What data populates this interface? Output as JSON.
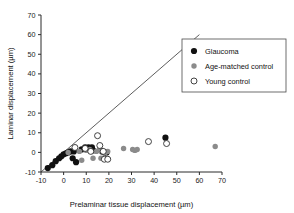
{
  "chart_data": {
    "type": "scatter",
    "title": "",
    "xlabel": "Prelaminar tissue displacement (µm)",
    "ylabel": "Laminar displacement (µm)",
    "xlim": [
      -10,
      70
    ],
    "ylim": [
      -10,
      70
    ],
    "xticks": [
      -10,
      0,
      10,
      20,
      30,
      40,
      50,
      60,
      70
    ],
    "yticks": [
      -10,
      0,
      10,
      20,
      30,
      40,
      50,
      60,
      70
    ],
    "xtick_labels": [
      "-10",
      "0",
      "10",
      "20",
      "30",
      "40",
      "50",
      "60",
      "70"
    ],
    "ytick_labels": [
      "-10",
      "0",
      "10",
      "20",
      "30",
      "40",
      "50",
      "60",
      "70"
    ],
    "grid": false,
    "legend_position": "upper-right",
    "reference_line": {
      "name": "identity-line",
      "label": "1:1 line",
      "x": [
        -10,
        60
      ],
      "y": [
        -10,
        60
      ]
    },
    "series": [
      {
        "name": "Glaucoma",
        "marker": "filled-circle",
        "color": "#111111",
        "points": [
          [
            -7.0,
            -8.0
          ],
          [
            -5.0,
            -6.5
          ],
          [
            -3.5,
            -4.5
          ],
          [
            -2.0,
            -3.0
          ],
          [
            -1.0,
            -2.0
          ],
          [
            0.0,
            -1.0
          ],
          [
            1.0,
            -0.5
          ],
          [
            2.0,
            0.0
          ],
          [
            3.0,
            0.5
          ],
          [
            4.0,
            -3.0
          ],
          [
            4.5,
            0.5
          ],
          [
            5.5,
            -5.0
          ],
          [
            8.0,
            1.5
          ],
          [
            9.5,
            2.5
          ],
          [
            11.0,
            2.5
          ],
          [
            12.5,
            2.5
          ],
          [
            13.0,
            1.0
          ],
          [
            17.0,
            0.5
          ],
          [
            18.0,
            0.0
          ],
          [
            19.0,
            0.0
          ],
          [
            45.0,
            7.5
          ]
        ]
      },
      {
        "name": "Age-matched control",
        "marker": "filled-circle-gray",
        "color": "#8b8b8b",
        "points": [
          [
            2.0,
            0.0
          ],
          [
            7.0,
            0.5
          ],
          [
            8.0,
            -4.0
          ],
          [
            10.0,
            1.0
          ],
          [
            11.5,
            1.5
          ],
          [
            13.0,
            -3.0
          ],
          [
            14.5,
            0.5
          ],
          [
            15.5,
            1.0
          ],
          [
            16.5,
            -3.0
          ],
          [
            18.5,
            0.0
          ],
          [
            19.5,
            0.5
          ],
          [
            26.5,
            2.0
          ],
          [
            30.5,
            1.5
          ],
          [
            31.5,
            1.0
          ],
          [
            32.5,
            1.5
          ],
          [
            67.0,
            3.0
          ]
        ]
      },
      {
        "name": "Young control",
        "marker": "open-circle",
        "color": "#ffffff",
        "points": [
          [
            5.0,
            2.5
          ],
          [
            9.5,
            2.0
          ],
          [
            12.0,
            0.5
          ],
          [
            15.0,
            8.5
          ],
          [
            16.0,
            3.5
          ],
          [
            17.5,
            0.5
          ],
          [
            18.0,
            -3.5
          ],
          [
            19.5,
            -3.5
          ],
          [
            37.5,
            5.5
          ],
          [
            45.5,
            4.5
          ]
        ]
      }
    ],
    "legend": [
      {
        "label": "Glaucoma",
        "marker": "filled-circle"
      },
      {
        "label": "Age-matched control",
        "marker": "filled-circle-gray"
      },
      {
        "label": "Young control",
        "marker": "open-circle"
      }
    ]
  }
}
